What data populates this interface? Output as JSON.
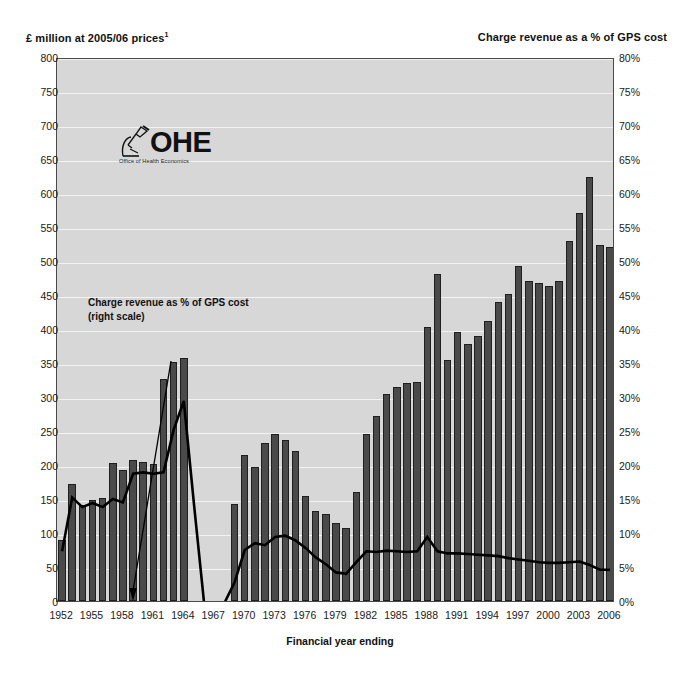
{
  "titles": {
    "left_axis_title": "£ million at 2005/06 prices",
    "left_axis_footnote_marker": "1",
    "right_axis_title": "Charge revenue as a % of GPS cost",
    "x_axis_title": "Financial year ending"
  },
  "logo": {
    "wordmark": "OHE",
    "subtitle": "Office of Health Economics",
    "mark_icon": "microscope-icon"
  },
  "annotation": {
    "line1": "Charge revenue as % of GPS cost",
    "line2": "(right scale)",
    "arrow_icon": "arrow-down-left-icon"
  },
  "colors": {
    "plot_background": "#d7d7d7",
    "gridline": "#f2f2f2",
    "bar_fill": "#4a4a4a",
    "bar_stroke": "#1f1f1f",
    "line": "#000000",
    "text": "#1a1a1a"
  },
  "chart_data": {
    "type": "bar",
    "title": "",
    "subtitle": "",
    "xlabel": "Financial year ending",
    "ylabel": "£ million at 2005/06 prices",
    "y2label": "Charge revenue as a % of GPS cost",
    "ylim": [
      0,
      800
    ],
    "y2lim": [
      0,
      80
    ],
    "ytick_step": 50,
    "y2tick_step": 5,
    "grid": true,
    "legend": "annotation-arrow",
    "yticks": [
      "0",
      "50",
      "100",
      "150",
      "200",
      "250",
      "300",
      "350",
      "400",
      "450",
      "500",
      "550",
      "600",
      "650",
      "700",
      "750",
      "800"
    ],
    "y2ticks": [
      "0%",
      "5%",
      "10%",
      "15%",
      "20%",
      "25%",
      "30%",
      "35%",
      "40%",
      "45%",
      "50%",
      "55%",
      "60%",
      "65%",
      "70%",
      "75%",
      "80%"
    ],
    "xticks": [
      "1952",
      "1955",
      "1958",
      "1961",
      "1964",
      "1967",
      "1970",
      "1973",
      "1976",
      "1979",
      "1982",
      "1985",
      "1988",
      "1991",
      "1994",
      "1997",
      "2000",
      "2003",
      "2006"
    ],
    "x": [
      1952,
      1953,
      1954,
      1955,
      1956,
      1957,
      1958,
      1959,
      1960,
      1961,
      1962,
      1963,
      1964,
      1965,
      1966,
      1967,
      1968,
      1969,
      1970,
      1971,
      1972,
      1973,
      1974,
      1975,
      1976,
      1977,
      1978,
      1979,
      1980,
      1981,
      1982,
      1983,
      1984,
      1985,
      1986,
      1987,
      1988,
      1989,
      1990,
      1991,
      1992,
      1993,
      1994,
      1995,
      1996,
      1997,
      1998,
      1999,
      2000,
      2001,
      2002,
      2003,
      2004,
      2005,
      2006
    ],
    "series": [
      {
        "name": "Prescription charge revenue (£ million at 2005/06 prices)",
        "axis": "left",
        "render": "bar",
        "values": [
          90,
          172,
          141,
          148,
          152,
          203,
          193,
          208,
          204,
          202,
          327,
          352,
          358,
          0,
          0,
          0,
          0,
          142,
          214,
          197,
          233,
          246,
          237,
          220,
          155,
          132,
          128,
          114,
          107,
          161,
          246,
          272,
          305,
          314,
          320,
          322,
          403,
          481,
          354,
          396,
          378,
          389,
          412,
          439,
          452,
          492,
          471,
          468,
          463,
          470,
          530,
          570,
          624,
          523,
          521
        ]
      },
      {
        "name": "Charge revenue as % of GPS cost (right scale)",
        "axis": "right",
        "render": "line",
        "values": [
          7.6,
          15.5,
          14.1,
          14.7,
          14.1,
          15.3,
          14.8,
          19.0,
          19.2,
          19.0,
          19.2,
          25.5,
          29.7,
          14.5,
          0,
          0,
          0,
          3.0,
          7.8,
          8.8,
          8.5,
          9.7,
          9.9,
          9.2,
          8.1,
          6.7,
          5.7,
          4.5,
          4.3,
          6.0,
          7.6,
          7.5,
          7.7,
          7.6,
          7.5,
          7.6,
          9.7,
          7.6,
          7.3,
          7.3,
          7.2,
          7.1,
          7.0,
          6.9,
          6.6,
          6.4,
          6.2,
          6.0,
          5.9,
          5.9,
          6.0,
          6.1,
          5.6,
          4.9,
          4.9
        ]
      }
    ]
  }
}
